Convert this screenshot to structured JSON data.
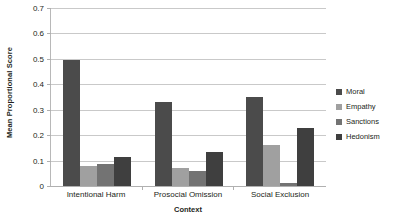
{
  "chart_data": {
    "type": "bar",
    "title": "",
    "subtitle": "",
    "xlabel": "Context",
    "ylabel": "Mean Proportional Score",
    "categories": [
      "Intentional Harm",
      "Prosocial Omission",
      "Social Exclusion"
    ],
    "series": [
      {
        "name": "Moral",
        "color": "#4b4b4b",
        "values": [
          0.495,
          0.33,
          0.35
        ]
      },
      {
        "name": "Empathy",
        "color": "#a0a0a0",
        "values": [
          0.08,
          0.07,
          0.16
        ]
      },
      {
        "name": "Sanctions",
        "color": "#737373",
        "values": [
          0.085,
          0.06,
          0.01
        ]
      },
      {
        "name": "Hedonism",
        "color": "#3f3f3f",
        "values": [
          0.115,
          0.135,
          0.23
        ]
      }
    ],
    "ylim": [
      0,
      0.7
    ],
    "ytick_step": 0.1,
    "ytick_labels": [
      "0",
      "0.1",
      "0.2",
      "0.3",
      "0.4",
      "0.5",
      "0.6",
      "0.7"
    ],
    "ytick_values": [
      0,
      0.1,
      0.2,
      0.3,
      0.4,
      0.5,
      0.6,
      0.7
    ],
    "grid": true,
    "legend_position": "right",
    "gridline_color": "#c9c9c9",
    "axis_color": "#b0b0b0",
    "background": "#ffffff",
    "text_color": "#231f20"
  }
}
